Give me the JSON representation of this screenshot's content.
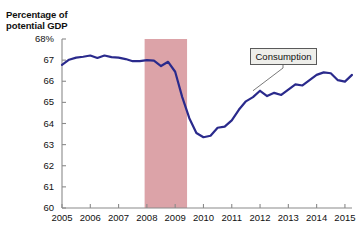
{
  "chart_data": {
    "type": "line",
    "title": "",
    "subtitle": "",
    "axis_title_line1": "Percentage of",
    "axis_title_line2": "potential GDP",
    "xlabel": "",
    "ylabel": "Percentage of potential GDP",
    "xlim": [
      2005,
      2015.25
    ],
    "ylim": [
      60,
      68
    ],
    "grid": false,
    "legend": "none",
    "line_color": "#2a2a8c",
    "shading_color": "#dca3a8",
    "axis_color": "#8a8a8a",
    "ytick_labels": [
      "68%",
      "67",
      "66",
      "65",
      "64",
      "63",
      "62",
      "61",
      "60"
    ],
    "ytick_values": [
      68,
      67,
      66,
      65,
      64,
      63,
      62,
      61,
      60
    ],
    "xtick_labels": [
      "2005",
      "2006",
      "2007",
      "2008",
      "2009",
      "2010",
      "2011",
      "2012",
      "2013",
      "2014",
      "2015"
    ],
    "xtick_values": [
      2005,
      2006,
      2007,
      2008,
      2009,
      2010,
      2011,
      2012,
      2013,
      2014,
      2015
    ],
    "annotations": [
      {
        "label": "Consumption",
        "box_x": 250,
        "box_y": 48,
        "leader_to_x": 2011.75,
        "leader_to_y": 65.55
      }
    ],
    "shaded_regions": [
      {
        "name": "recession",
        "x_start": 2007.92,
        "x_end": 2009.42,
        "color": "#dca3a8"
      }
    ],
    "series": [
      {
        "name": "Consumption",
        "color": "#2a2a8c",
        "x": [
          2005.0,
          2005.25,
          2005.5,
          2005.75,
          2006.0,
          2006.25,
          2006.5,
          2006.75,
          2007.0,
          2007.25,
          2007.5,
          2007.75,
          2008.0,
          2008.25,
          2008.5,
          2008.75,
          2009.0,
          2009.25,
          2009.5,
          2009.75,
          2010.0,
          2010.25,
          2010.5,
          2010.75,
          2011.0,
          2011.25,
          2011.5,
          2011.75,
          2012.0,
          2012.25,
          2012.5,
          2012.75,
          2013.0,
          2013.25,
          2013.5,
          2013.75,
          2014.0,
          2014.25,
          2014.5,
          2014.75,
          2015.0,
          2015.25
        ],
        "y": [
          66.78,
          67.02,
          67.12,
          67.16,
          67.22,
          67.1,
          67.22,
          67.14,
          67.12,
          67.05,
          66.95,
          66.95,
          67.0,
          66.98,
          66.72,
          66.92,
          66.45,
          65.25,
          64.25,
          63.55,
          63.35,
          63.42,
          63.8,
          63.85,
          64.15,
          64.65,
          65.05,
          65.25,
          65.55,
          65.3,
          65.45,
          65.35,
          65.6,
          65.85,
          65.8,
          66.05,
          66.3,
          66.42,
          66.38,
          66.05,
          65.98,
          66.3
        ]
      }
    ]
  }
}
